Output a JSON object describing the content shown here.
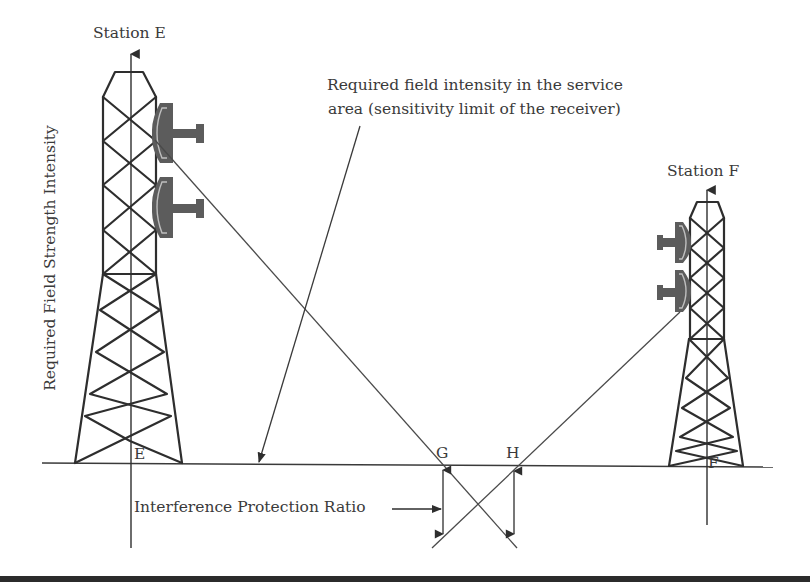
{
  "diagram": {
    "type": "interference-protection-diagram",
    "stations": [
      {
        "id": "E",
        "title": "Station E",
        "ground_label": "E"
      },
      {
        "id": "F",
        "title": "Station F",
        "ground_label": "F"
      }
    ],
    "points": [
      {
        "id": "G",
        "label": "G"
      },
      {
        "id": "H",
        "label": "H"
      }
    ],
    "labels": {
      "y_axis": "Required Field Strength Intensity",
      "callout_line1": "Required field intensity in the service",
      "callout_line2": "area (sensitivity limit of the receiver)",
      "protection_ratio": "Interference Protection Ratio"
    },
    "colors": {
      "line": "#2e2e2e",
      "dish": "#5c5c5c",
      "text": "#3a3a3a",
      "background": "#ffffff",
      "bottom_bar": "#2b2b2b"
    }
  }
}
